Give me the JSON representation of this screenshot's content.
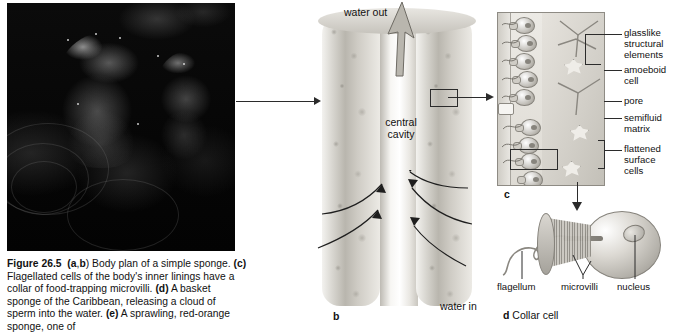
{
  "figure": {
    "number": "Figure 26.5",
    "caption_parts": [
      {
        "bold": "Figure 26.5",
        "text": ""
      },
      {
        "bold": "(a,b)",
        "text": " Body plan of a simple sponge. "
      },
      {
        "bold": "(c)",
        "text": " Flagellated cells of the body's inner linings have a collar of food-trapping microvilli. "
      },
      {
        "bold": "(d)",
        "text": " A basket sponge of the Caribbean, releasing a cloud of sperm into the water. "
      },
      {
        "bold": "(e)",
        "text": " A sprawling, red-orange sponge, one of"
      }
    ],
    "caption_full": "Figure 26.5 (a,b) Body plan of a simple sponge. (c) Flagellated cells of the body's inner linings have a collar of food-trapping microvilli. (d) A basket sponge of the Caribbean, releasing a cloud of sperm into the water. (e) A sprawling, red-orange sponge, one of"
  },
  "panel_a": {
    "name": "sponge-photograph",
    "description": "dark underwater photograph of two sponges on a reef"
  },
  "panel_b": {
    "letter": "b",
    "labels": {
      "water_out": "water out",
      "central_cavity": "central\ncavity",
      "central_cavity_line1": "central",
      "central_cavity_line2": "cavity",
      "water_in": "water in"
    }
  },
  "panel_c": {
    "letter": "c",
    "labels": [
      {
        "id": "glasslike-structural-elements",
        "lines": [
          "glasslike",
          "structural",
          "elements"
        ]
      },
      {
        "id": "amoeboid-cell",
        "lines": [
          "amoeboid",
          "cell"
        ]
      },
      {
        "id": "pore",
        "lines": [
          "pore"
        ]
      },
      {
        "id": "semifluid-matrix",
        "lines": [
          "semifluid",
          "matrix"
        ]
      },
      {
        "id": "flattened-surface-cells",
        "lines": [
          "flattened",
          "surface",
          "cells"
        ]
      }
    ]
  },
  "panel_d": {
    "letter": "d",
    "title": "Collar cell",
    "labels": {
      "flagellum": "flagellum",
      "microvilli": "microvilli",
      "nucleus": "nucleus"
    }
  },
  "colors": {
    "ink": "#1a1a1a",
    "leader": "#2b2b2b",
    "photo_bg": "#050505",
    "tissue_light": "#eceae5",
    "tissue_mid": "#b9b6ae"
  }
}
